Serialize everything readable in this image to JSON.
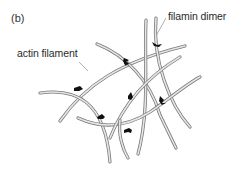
{
  "panel_label": "(b)",
  "labels": {
    "actin_filament": "actin filament",
    "filamin_dimer": "filamin dimer"
  },
  "colors": {
    "filament_outline": "#7a7a7a",
    "filament_fill": "#e6e6e6",
    "filamin": "#111111",
    "leader_line": "#9a9a9a",
    "text": "#2a2a2a"
  }
}
